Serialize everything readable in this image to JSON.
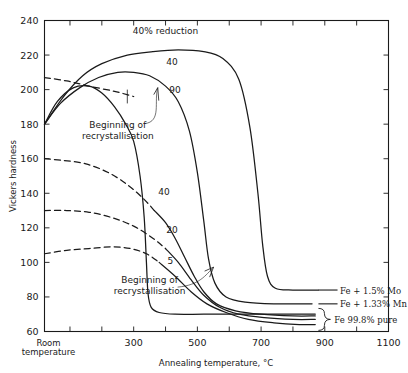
{
  "chart_data": {
    "type": "line",
    "title": "",
    "xlabel": "Annealing temperature, °C",
    "ylabel": "Vickers hardness",
    "xlim": [
      20,
      1100
    ],
    "ylim": [
      60,
      240
    ],
    "grid": false,
    "legend_position": "right-inline",
    "x_ticks": [
      100,
      200,
      300,
      400,
      500,
      600,
      700,
      800,
      900,
      1000,
      1100
    ],
    "x_tick_labels": [
      "",
      "",
      "300",
      "",
      "500",
      "",
      "700",
      "",
      "900",
      "",
      "1100"
    ],
    "x_origin_label": "Room temperature",
    "y_ticks": [
      60,
      80,
      100,
      120,
      140,
      160,
      180,
      200,
      220,
      240
    ],
    "y_tick_labels": [
      "60",
      "80",
      "100",
      "120",
      "140",
      "160",
      "180",
      "200",
      "220",
      "240"
    ],
    "series": [
      {
        "name": "Fe + 1.5% Mo, 40% reduction",
        "label": "40% reduction",
        "group": "Fe + 1.5% Mo",
        "style": "solid",
        "points": [
          [
            20,
            180
          ],
          [
            80,
            196
          ],
          [
            140,
            208
          ],
          [
            200,
            215
          ],
          [
            280,
            220
          ],
          [
            360,
            222
          ],
          [
            440,
            223
          ],
          [
            520,
            222
          ],
          [
            580,
            218
          ],
          [
            630,
            206
          ],
          [
            665,
            178
          ],
          [
            690,
            140
          ],
          [
            705,
            110
          ],
          [
            720,
            92
          ],
          [
            745,
            85
          ],
          [
            800,
            84
          ],
          [
            880,
            84
          ]
        ]
      },
      {
        "name": "Fe + 1.5% Mo, 90% reduction dashed onset",
        "label": "",
        "group": "Fe + 1.5% Mo",
        "style": "dashed",
        "points": [
          [
            20,
            207
          ],
          [
            90,
            205
          ],
          [
            160,
            202
          ],
          [
            240,
            199
          ],
          [
            300,
            196
          ]
        ]
      },
      {
        "name": "Fe + 1.33% Mn, 40% reduction",
        "label": "40",
        "group": "Fe + 1.33% Mn",
        "style": "solid",
        "points": [
          [
            20,
            180
          ],
          [
            70,
            192
          ],
          [
            130,
            201
          ],
          [
            190,
            207
          ],
          [
            250,
            210
          ],
          [
            300,
            210
          ],
          [
            350,
            208
          ],
          [
            400,
            202
          ],
          [
            440,
            193
          ],
          [
            475,
            176
          ],
          [
            500,
            152
          ],
          [
            520,
            124
          ],
          [
            535,
            102
          ],
          [
            555,
            88
          ],
          [
            590,
            80
          ],
          [
            650,
            77
          ],
          [
            740,
            76
          ],
          [
            860,
            76
          ]
        ]
      },
      {
        "name": "Fe + 1.33% Mn, 90% reduction",
        "label": "90",
        "group": "Fe + 1.33% Mn",
        "style": "solid",
        "points": [
          [
            20,
            180
          ],
          [
            60,
            193
          ],
          [
            110,
            201
          ],
          [
            160,
            202
          ],
          [
            200,
            198
          ],
          [
            240,
            190
          ],
          [
            275,
            180
          ],
          [
            300,
            170
          ],
          [
            320,
            150
          ],
          [
            333,
            126
          ],
          [
            340,
            100
          ],
          [
            345,
            82
          ],
          [
            355,
            74
          ],
          [
            380,
            71
          ],
          [
            430,
            70
          ],
          [
            520,
            70
          ],
          [
            640,
            70
          ],
          [
            800,
            70
          ],
          [
            870,
            70
          ]
        ]
      },
      {
        "name": "Fe 99.8% pure, 40% reduction",
        "label": "40",
        "group": "Fe 99.8% pure",
        "style": "dashed",
        "points": [
          [
            20,
            160
          ],
          [
            80,
            159
          ],
          [
            150,
            157
          ],
          [
            220,
            152
          ],
          [
            280,
            145
          ],
          [
            330,
            137
          ],
          [
            365,
            130
          ]
        ]
      },
      {
        "name": "Fe 99.8% pure, 40% reduction solid",
        "label": "",
        "group": "Fe 99.8% pure",
        "style": "solid",
        "points": [
          [
            365,
            130
          ],
          [
            400,
            123
          ],
          [
            430,
            114
          ],
          [
            460,
            103
          ],
          [
            490,
            92
          ],
          [
            520,
            83
          ],
          [
            560,
            76
          ],
          [
            620,
            72
          ],
          [
            700,
            70
          ],
          [
            800,
            69
          ],
          [
            870,
            69
          ]
        ]
      },
      {
        "name": "Fe 99.8% pure, 20% reduction",
        "label": "20",
        "group": "Fe 99.8% pure",
        "style": "dashed",
        "points": [
          [
            20,
            130
          ],
          [
            90,
            130
          ],
          [
            160,
            129
          ],
          [
            230,
            126
          ],
          [
            300,
            121
          ],
          [
            360,
            114
          ],
          [
            400,
            108
          ]
        ]
      },
      {
        "name": "Fe 99.8% pure, 20% reduction solid",
        "label": "",
        "group": "Fe 99.8% pure",
        "style": "solid",
        "points": [
          [
            400,
            108
          ],
          [
            440,
            100
          ],
          [
            480,
            90
          ],
          [
            520,
            81
          ],
          [
            570,
            74
          ],
          [
            630,
            70
          ],
          [
            710,
            68
          ],
          [
            800,
            67
          ],
          [
            870,
            67
          ]
        ]
      },
      {
        "name": "Fe 99.8% pure, 5% reduction",
        "label": "5",
        "group": "Fe 99.8% pure",
        "style": "dashed",
        "points": [
          [
            20,
            105
          ],
          [
            90,
            107
          ],
          [
            160,
            108
          ],
          [
            230,
            109
          ],
          [
            290,
            108
          ],
          [
            340,
            105
          ],
          [
            380,
            100
          ]
        ]
      },
      {
        "name": "Fe 99.8% pure, 5% reduction solid",
        "label": "",
        "group": "Fe 99.8% pure",
        "style": "solid",
        "points": [
          [
            380,
            100
          ],
          [
            430,
            92
          ],
          [
            480,
            83
          ],
          [
            530,
            76
          ],
          [
            590,
            71
          ],
          [
            660,
            67
          ],
          [
            740,
            65
          ],
          [
            820,
            64
          ],
          [
            870,
            64
          ]
        ]
      }
    ],
    "curve_labels": [
      {
        "text": "40% reduction",
        "x": 400,
        "y": 232
      },
      {
        "text": "40",
        "x": 420,
        "y": 214
      },
      {
        "text": "90",
        "x": 430,
        "y": 198
      },
      {
        "text": "40",
        "x": 395,
        "y": 139
      },
      {
        "text": "20",
        "x": 420,
        "y": 117
      },
      {
        "text": "5",
        "x": 415,
        "y": 99
      }
    ],
    "annotations": [
      {
        "text_line1": "Beginning of",
        "text_line2": "recrystallisation",
        "x": 250,
        "y": 178
      },
      {
        "text_line1": "Beginning of",
        "text_line2": "recrystallisation",
        "x": 350,
        "y": 88
      }
    ],
    "series_labels_right": [
      {
        "text": "Fe + 1.5% Mo",
        "y": 84
      },
      {
        "text": "Fe + 1.33% Mn",
        "y": 76
      },
      {
        "text": "Fe 99.8% pure",
        "y": 67
      }
    ]
  }
}
